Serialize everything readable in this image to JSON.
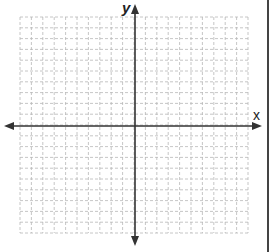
{
  "diagram": {
    "type": "coordinate-plane",
    "axes": {
      "x_label": "x",
      "y_label": "y"
    },
    "grid": {
      "columns": 20,
      "rows": 20,
      "line_style": "dashed",
      "line_color": "#b8b8b8"
    },
    "colors": {
      "axis": "#333333",
      "border": "#444444",
      "background": "#ffffff"
    }
  }
}
